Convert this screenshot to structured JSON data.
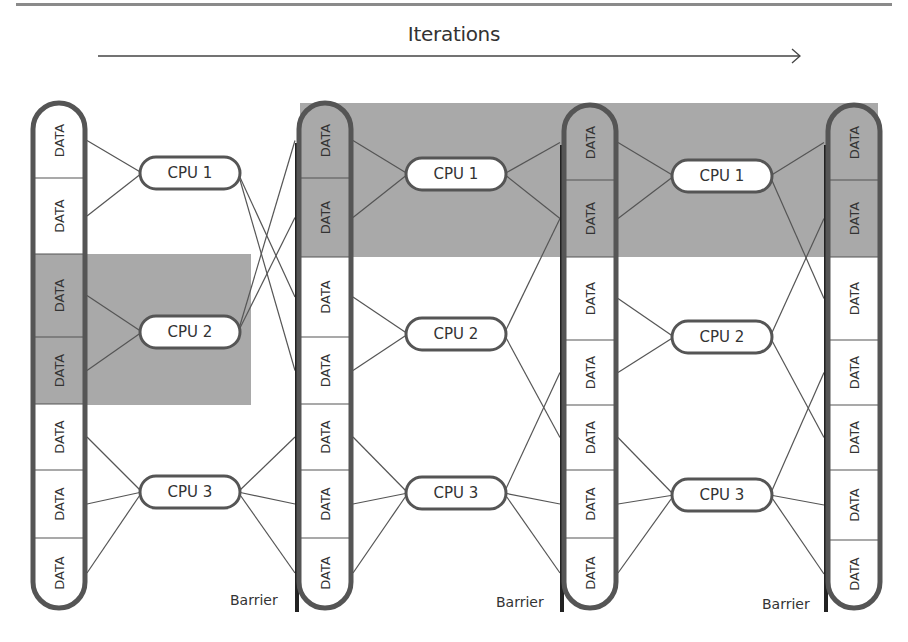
{
  "title": "Iterations",
  "colors": {
    "highlight": "#a9a9a9",
    "pill_border": "#555555",
    "barrier_line": "#222222",
    "connector": "#555555",
    "background": "#ffffff"
  },
  "data_label": "DATA",
  "barrier_label": "Barrier",
  "highlights": [
    {
      "id": "mid-left",
      "x": 84,
      "y": 254,
      "w": 167,
      "h": 151
    },
    {
      "id": "top-band",
      "x": 300,
      "y": 103,
      "w": 578,
      "h": 154
    }
  ],
  "columns": [
    {
      "id": "col-1",
      "x": 33,
      "width": 52,
      "top": 103,
      "bottom": 608,
      "barrier": false,
      "dividers": [
        178,
        254,
        337,
        404,
        470,
        538
      ],
      "segments": [
        "DATA",
        "DATA",
        "DATA",
        "DATA",
        "DATA",
        "DATA",
        "DATA"
      ],
      "shaded": [
        2,
        3
      ]
    },
    {
      "id": "col-2",
      "x": 299,
      "width": 52,
      "top": 103,
      "bottom": 608,
      "barrier": true,
      "barrier_x": 297,
      "dividers": [
        178,
        257,
        337,
        404,
        470,
        538
      ],
      "segments": [
        "DATA",
        "DATA",
        "DATA",
        "DATA",
        "DATA",
        "DATA",
        "DATA"
      ],
      "shaded": [
        0,
        1
      ]
    },
    {
      "id": "col-3",
      "x": 564,
      "width": 52,
      "top": 105,
      "bottom": 608,
      "barrier": true,
      "barrier_x": 562,
      "dividers": [
        180,
        257,
        340,
        405,
        470,
        538
      ],
      "segments": [
        "DATA",
        "DATA",
        "DATA",
        "DATA",
        "DATA",
        "DATA",
        "DATA"
      ],
      "shaded": [
        0,
        1
      ]
    },
    {
      "id": "col-4",
      "x": 828,
      "width": 52,
      "top": 105,
      "bottom": 608,
      "barrier": true,
      "barrier_x": 826,
      "dividers": [
        180,
        257,
        340,
        405,
        470,
        540
      ],
      "segments": [
        "DATA",
        "DATA",
        "DATA",
        "DATA",
        "DATA",
        "DATA",
        "DATA"
      ],
      "shaded": [
        0,
        1
      ]
    }
  ],
  "cpu_groups": [
    {
      "stage": 1,
      "cpus": [
        {
          "label": "CPU 1",
          "cx": 190,
          "cy": 173
        },
        {
          "label": "CPU 2",
          "cx": 190,
          "cy": 332
        },
        {
          "label": "CPU 3",
          "cx": 190,
          "cy": 492
        }
      ]
    },
    {
      "stage": 2,
      "cpus": [
        {
          "label": "CPU 1",
          "cx": 456,
          "cy": 174
        },
        {
          "label": "CPU 2",
          "cx": 456,
          "cy": 334
        },
        {
          "label": "CPU 3",
          "cx": 456,
          "cy": 493
        }
      ]
    },
    {
      "stage": 3,
      "cpus": [
        {
          "label": "CPU 1",
          "cx": 722,
          "cy": 176
        },
        {
          "label": "CPU 2",
          "cx": 722,
          "cy": 337
        },
        {
          "label": "CPU 3",
          "cx": 722,
          "cy": 495
        }
      ]
    }
  ],
  "connections": {
    "stage1_in": [
      [
        0,
        [
          0,
          1
        ]
      ],
      [
        1,
        [
          2,
          3
        ]
      ],
      [
        2,
        [
          4,
          5,
          6
        ]
      ]
    ],
    "stage1_out": [
      [
        0,
        [
          2,
          3
        ]
      ],
      [
        1,
        [
          0,
          1
        ]
      ],
      [
        2,
        [
          4,
          5,
          6
        ]
      ]
    ],
    "stage2_in": [
      [
        0,
        [
          0,
          1
        ]
      ],
      [
        1,
        [
          2,
          3
        ]
      ],
      [
        2,
        [
          4,
          5,
          6
        ]
      ]
    ],
    "stage2_out": [
      [
        0,
        [
          0,
          1
        ]
      ],
      [
        1,
        [
          1,
          4
        ]
      ],
      [
        2,
        [
          3,
          5,
          6
        ]
      ]
    ],
    "stage3_in": [
      [
        0,
        [
          0,
          1
        ]
      ],
      [
        1,
        [
          2,
          3
        ]
      ],
      [
        2,
        [
          4,
          5,
          6
        ]
      ]
    ],
    "stage3_out": [
      [
        0,
        [
          0,
          2
        ]
      ],
      [
        1,
        [
          1,
          4
        ]
      ],
      [
        2,
        [
          3,
          5,
          6
        ]
      ]
    ]
  },
  "barriers": [
    {
      "label": "Barrier",
      "x": 230,
      "y": 592
    },
    {
      "label": "Barrier",
      "x": 496,
      "y": 594
    },
    {
      "label": "Barrier",
      "x": 762,
      "y": 596
    }
  ],
  "arrow": {
    "x1": 98,
    "y1": 56,
    "x2": 800,
    "y2": 56
  }
}
